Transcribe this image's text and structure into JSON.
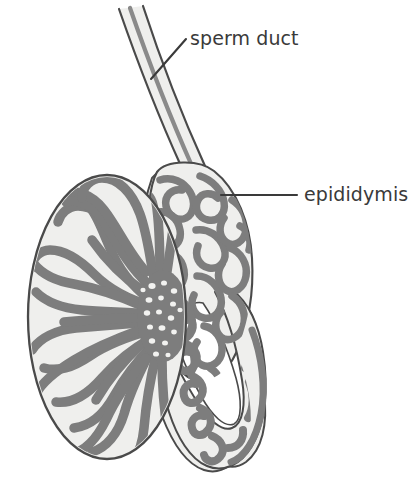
{
  "figure": {
    "type": "anatomical-diagram",
    "background_color": "#ffffff",
    "palette": {
      "outline": "#4a4a4a",
      "tubule_fill": "#7d7d7d",
      "capsule_fill": "#efefed",
      "interior_void": "#ffffff",
      "label_text": "#3a3a3a",
      "leader_line": "#3a3a3a"
    },
    "labels": [
      {
        "id": "sperm-duct",
        "text": "sperm duct",
        "text_x": 190,
        "text_y": 45,
        "leader": {
          "x1": 186,
          "y1": 39,
          "x2": 151,
          "y2": 79
        }
      },
      {
        "id": "epididymis",
        "text": "epididymis",
        "text_x": 304,
        "text_y": 201,
        "leader": {
          "x1": 297,
          "y1": 195,
          "x2": 221,
          "y2": 195
        }
      }
    ],
    "parts": [
      {
        "id": "testis",
        "name": "testis",
        "shape": "oval",
        "cx": 107,
        "cy": 317,
        "rx": 80,
        "ry": 143
      },
      {
        "id": "epididymis-body",
        "name": "epididymis",
        "shape": "looping-band"
      },
      {
        "id": "sperm-duct-tube",
        "name": "sperm duct",
        "shape": "tube"
      },
      {
        "id": "mediastinum",
        "name": "mediastinum testis",
        "cx": 164,
        "cy": 316
      }
    ],
    "lobule_count": 22,
    "caption": ""
  }
}
